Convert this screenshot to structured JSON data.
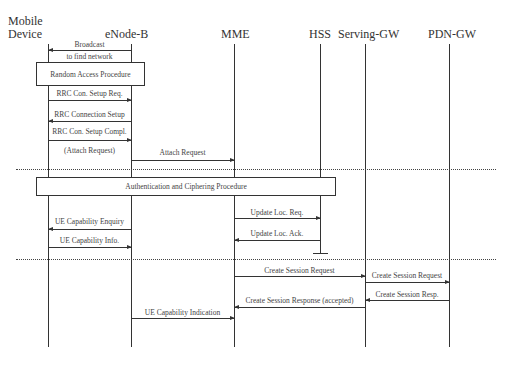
{
  "participants": [
    {
      "id": "mobile",
      "label_line1": "Mobile",
      "label_line2": "Device"
    },
    {
      "id": "enb",
      "label": "eNode-B"
    },
    {
      "id": "mme",
      "label": "MME"
    },
    {
      "id": "hss",
      "label": "HSS"
    },
    {
      "id": "sgw",
      "label": "Serving-GW"
    },
    {
      "id": "pgw",
      "label": "PDN-GW"
    }
  ],
  "messages": [
    {
      "from": "eNode-B",
      "to": "Mobile Device",
      "label_line1": "Broadcast",
      "label_line2": "to find network"
    },
    {
      "from": "Mobile Device",
      "to": "eNode-B",
      "label": "RRC Con. Setup Req."
    },
    {
      "from": "eNode-B",
      "to": "Mobile Device",
      "label": "RRC Connection Setup"
    },
    {
      "from": "Mobile Device",
      "to": "eNode-B",
      "label": "RRC Con. Setup Compl.",
      "sublabel": "(Attach Request)"
    },
    {
      "from": "eNode-B",
      "to": "MME",
      "label": "Attach Request"
    },
    {
      "from": "MME",
      "to": "HSS",
      "label": "Update Loc. Req."
    },
    {
      "from": "eNode-B",
      "to": "Mobile Device",
      "label": "UE Capability Enquiry"
    },
    {
      "from": "Mobile Device",
      "to": "eNode-B",
      "label": "UE Capability Info."
    },
    {
      "from": "HSS",
      "to": "MME",
      "label": "Update Loc. Ack."
    },
    {
      "from": "MME",
      "to": "Serving-GW",
      "label": "Create Session Request"
    },
    {
      "from": "Serving-GW",
      "to": "PDN-GW",
      "label": "Create Session Request"
    },
    {
      "from": "PDN-GW",
      "to": "Serving-GW",
      "label": "Create Session Resp."
    },
    {
      "from": "Serving-GW",
      "to": "MME",
      "label": "Create Session Response (accepted)"
    },
    {
      "from": "eNode-B",
      "to": "MME",
      "label": "UE Capability Indication"
    }
  ],
  "procedures": [
    {
      "label": "Random Access Procedure"
    },
    {
      "label": "Authentication and Ciphering Procedure"
    }
  ]
}
